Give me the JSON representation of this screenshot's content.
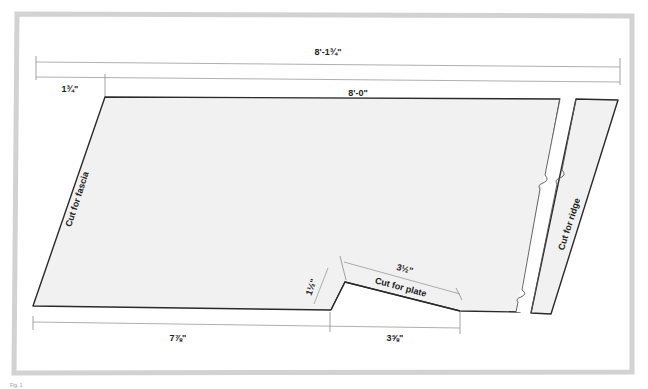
{
  "diagram": {
    "type": "rafter-template-layout",
    "dimensions": {
      "overall_length": "8'-1¾\"",
      "rafter_length": "8'-0\"",
      "overhang_offset": "1¾\"",
      "bottom_run": "7⅞\"",
      "plate_cut_height": "1½\"",
      "plate_cut_length": "3½\"",
      "plate_cut_horizontal": "3⅝\""
    },
    "labels": {
      "cut_fascia": "Cut for fascia",
      "cut_ridge": "Cut for ridge",
      "cut_plate": "Cut for plate"
    },
    "caption": "Fig. 1"
  }
}
